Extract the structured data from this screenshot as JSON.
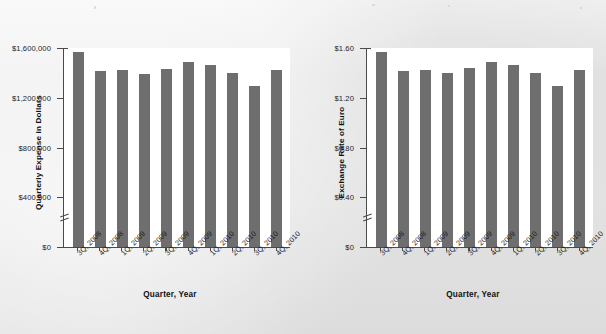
{
  "page": {
    "background_color": "#e9e9e9",
    "bar_color": "#6e6e6e",
    "axis_color": "#4a4a4a",
    "plot_background": "#ffffff"
  },
  "charts": [
    {
      "id": "quarterly-expense-chart",
      "ylabel": "Quarterly Expense in Dollars",
      "xlabel": "Quarter, Year",
      "ytick_labels": [
        "$1,600,000",
        "$1,200,000",
        "$800,000",
        "$400,000",
        "$0"
      ],
      "axis_break": true
    },
    {
      "id": "exchange-rate-chart",
      "ylabel": "Exchange Rate of Euro",
      "xlabel": "Quarter, Year",
      "ytick_labels": [
        "$1.60",
        "$1.20",
        "$0.80",
        "$0.40",
        "$0"
      ],
      "axis_break": true
    }
  ],
  "chart_data": [
    {
      "type": "bar",
      "title": "",
      "xlabel": "Quarter, Year",
      "ylabel": "Quarterly Expense in Dollars",
      "categories": [
        "3Q, 2008",
        "4Q, 2008",
        "1Q, 2009",
        "2Q, 2009",
        "3Q, 2009",
        "4Q, 2009",
        "1Q, 2010",
        "2Q, 2010",
        "3Q, 2010",
        "4Q, 2010"
      ],
      "values": [
        1570000,
        1420000,
        1425000,
        1395000,
        1435000,
        1490000,
        1465000,
        1400000,
        1300000,
        1425000
      ],
      "ylim": [
        0,
        1600000
      ],
      "yticks": [
        0,
        400000,
        800000,
        1200000,
        1600000
      ],
      "ytick_labels": [
        "$0",
        "$400,000",
        "$800,000",
        "$1,200,000",
        "$1,600,000"
      ],
      "grid": false,
      "legend": null,
      "axis_break_between": [
        0,
        400000
      ]
    },
    {
      "type": "bar",
      "title": "",
      "xlabel": "Quarter, Year",
      "ylabel": "Exchange Rate of Euro",
      "categories": [
        "3Q, 2008",
        "4Q, 2008",
        "1Q, 2009",
        "2Q, 2009",
        "3Q, 2009",
        "4Q, 2009",
        "1Q, 2010",
        "2Q, 2010",
        "3Q, 2010",
        "4Q, 2010"
      ],
      "values": [
        1.57,
        1.42,
        1.43,
        1.4,
        1.44,
        1.49,
        1.47,
        1.4,
        1.3,
        1.43
      ],
      "ylim": [
        0,
        1.6
      ],
      "yticks": [
        0,
        0.4,
        0.8,
        1.2,
        1.6
      ],
      "ytick_labels": [
        "$0",
        "$0.40",
        "$0.80",
        "$1.20",
        "$1.60"
      ],
      "grid": false,
      "legend": null,
      "axis_break_between": [
        0,
        0.4
      ]
    }
  ]
}
